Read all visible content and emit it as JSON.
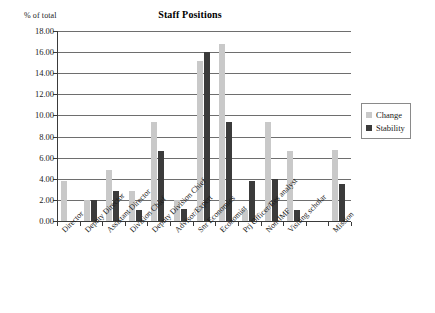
{
  "chart_data": {
    "type": "bar",
    "title": "Staff Positions",
    "ylabel": "% of total",
    "xlabel": "",
    "ylim": [
      0,
      18
    ],
    "ytick_step": 2,
    "grid": true,
    "legend_position": "right",
    "ytick_labels": [
      "18.00",
      "16.00",
      "14.00",
      "12.00",
      "10.00",
      "8.00",
      "6.00",
      "4.00",
      "2.00",
      "0.00"
    ],
    "categories": [
      "Director",
      "Deputy Director",
      "Assistant Director",
      "Division Chief",
      "Deputy Division Chief",
      "Advisor/Expert",
      "Snr Economics",
      "Economist",
      "Prj Officer/Res analyst",
      "Non-IMF",
      "Visiting scholar",
      "",
      "Mission"
    ],
    "series": [
      {
        "name": "Change",
        "color": "#c9c9c9",
        "values": [
          3.8,
          2.0,
          4.8,
          2.8,
          9.4,
          2.0,
          15.2,
          16.8,
          1.0,
          9.4,
          6.6,
          null,
          6.7
        ]
      },
      {
        "name": "Stability",
        "color": "#3b3b3b",
        "values": [
          0.0,
          2.0,
          2.8,
          1.0,
          6.6,
          1.1,
          16.0,
          9.4,
          3.8,
          4.0,
          1.0,
          null,
          3.5
        ]
      }
    ]
  },
  "legend": {
    "items": [
      {
        "label": "Change",
        "color": "#c9c9c9"
      },
      {
        "label": "Stability",
        "color": "#3b3b3b"
      }
    ]
  }
}
